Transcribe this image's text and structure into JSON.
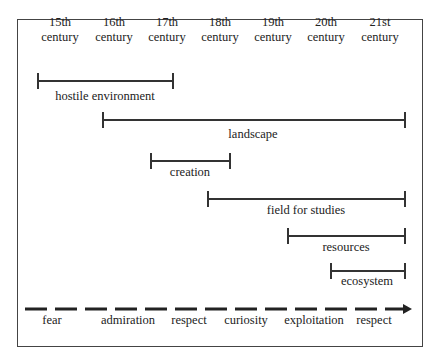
{
  "centuries": [
    {
      "line1": "15th",
      "line2": "century"
    },
    {
      "line1": "16th",
      "line2": "century"
    },
    {
      "line1": "17th",
      "line2": "century"
    },
    {
      "line1": "18th",
      "line2": "century"
    },
    {
      "line1": "19th",
      "line2": "century"
    },
    {
      "line1": "20th",
      "line2": "century"
    },
    {
      "line1": "21st",
      "line2": "century"
    }
  ],
  "periods": [
    {
      "label": "hostile environment",
      "start": "15th century",
      "end": "17th century"
    },
    {
      "label": "landscape",
      "start": "16th century",
      "end": "21st century"
    },
    {
      "label": "creation",
      "start": "17th century",
      "end": "18th century"
    },
    {
      "label": "field for studies",
      "start": "18th century",
      "end": "21st century"
    },
    {
      "label": "resources",
      "start": "19th century",
      "end": "21st century"
    },
    {
      "label": "ecosystem",
      "start": "20th century",
      "end": "21st century"
    }
  ],
  "attitudes": [
    "fear",
    "admiration",
    "respect",
    "curiosity",
    "exploitation",
    "respect"
  ]
}
